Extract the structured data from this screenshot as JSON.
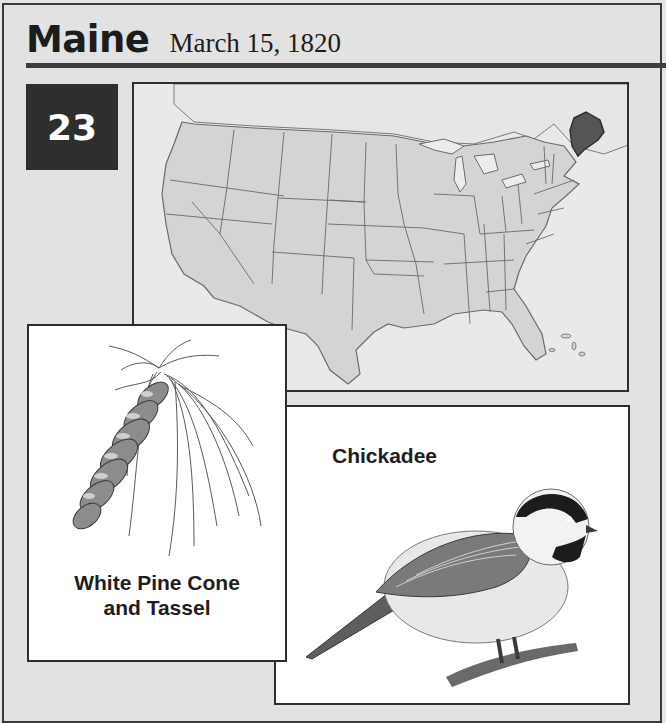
{
  "header": {
    "state_name": "Maine",
    "admission_date": "March 15, 1820"
  },
  "order_badge": {
    "number": "23"
  },
  "map": {
    "description": "Map of the contiguous United States with Maine highlighted",
    "highlighted_state": "Maine",
    "highlight_color": "#555555",
    "state_fill": "#d4d4d4",
    "border_color": "#6a6a6a"
  },
  "symbols": {
    "tree": {
      "caption_line1": "White Pine Cone",
      "caption_line2": "and Tassel",
      "icon": "pine-cone-icon"
    },
    "bird": {
      "caption": "Chickadee",
      "icon": "chickadee-icon"
    }
  },
  "colors": {
    "background": "#e4e4e4",
    "frame": "#3a3a3a",
    "badge_bg": "#2e2e2e",
    "badge_text": "#ffffff"
  }
}
